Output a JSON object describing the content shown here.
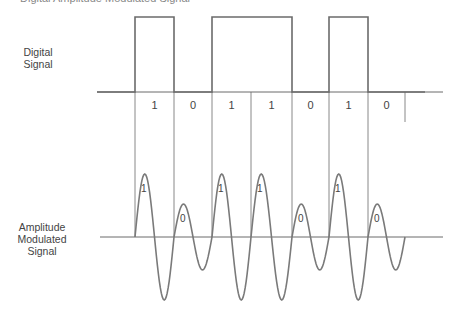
{
  "caption": "Digital Amplitude Modulated Signal",
  "labels": {
    "digital": [
      "Digital",
      "Signal"
    ],
    "analog": [
      "Amplitude",
      "Modulated",
      "Signal"
    ]
  },
  "bits": [
    "1",
    "0",
    "1",
    "1",
    "0",
    "1",
    "0"
  ],
  "geometry": {
    "bit_edges": [
      135,
      174,
      212,
      251,
      292,
      329,
      368,
      405
    ],
    "digital_baseline_y": 92,
    "digital_high_y": 17,
    "digital_axis": [
      97,
      443
    ],
    "am_baseline_y": 237,
    "am_axis": [
      100,
      443
    ],
    "amp_high": 63,
    "amp_low": 33,
    "bit_label_y": 109
  },
  "colors": {
    "line": "#6b6b6b",
    "wave": "#7a7a7a",
    "text": "#444444"
  }
}
